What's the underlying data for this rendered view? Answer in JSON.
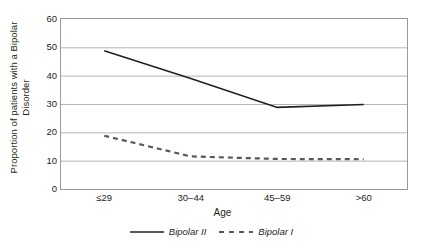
{
  "chart_data": {
    "type": "line",
    "title": "",
    "xlabel": "Age",
    "ylabel": "Proportion of patients with a Bipolar Disorder",
    "ylabel_line1": "Proportion of patients with a Bipolar",
    "ylabel_line2": "Disorder",
    "categories": [
      "≤29",
      "30–44",
      "45–59",
      ">60"
    ],
    "ylim": [
      0,
      60
    ],
    "yticks": [
      60,
      50,
      40,
      30,
      20,
      10,
      0
    ],
    "ytick_labels": [
      "60",
      "50",
      "40",
      "30",
      "20",
      "10",
      "0"
    ],
    "grid": true,
    "grid_axis": "y",
    "legend_position": "bottom",
    "series": [
      {
        "name": "Bipolar II",
        "style": "solid",
        "color": "#231f20",
        "values": [
          48.8,
          39.0,
          28.8,
          29.8
        ]
      },
      {
        "name": "Bipolar I",
        "style": "dashed",
        "color": "#58595b",
        "values": [
          18.8,
          11.5,
          10.6,
          10.5
        ]
      }
    ]
  },
  "legend": {
    "items": [
      {
        "label": "Bipolar II",
        "style": "solid",
        "color": "#231f20"
      },
      {
        "label": "Bipolar I",
        "style": "dashed",
        "color": "#58595b"
      }
    ]
  },
  "colors": {
    "axis": "#9a9a9a",
    "grid": "#b5b5b5",
    "text": "#231f20",
    "series_solid": "#231f20",
    "series_dashed": "#58595b"
  }
}
